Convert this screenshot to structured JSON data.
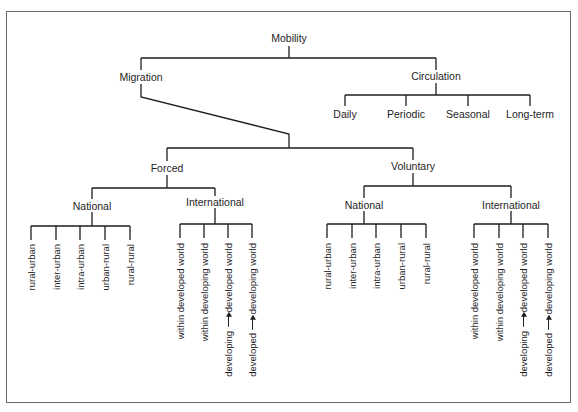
{
  "diagram": {
    "root": "Mobility",
    "level1": {
      "migration": "Migration",
      "circulation": "Circulation"
    },
    "circulation_types": [
      "Daily",
      "Periodic",
      "Seasonal",
      "Long-term"
    ],
    "migration_types": {
      "forced": "Forced",
      "voluntary": "Voluntary"
    },
    "forced": {
      "national": {
        "label": "National",
        "leaves": [
          "rural-urban",
          "inter-urban",
          "intra-urban",
          "urban-rural",
          "rural-rural"
        ]
      },
      "international": {
        "label": "International",
        "leaves": [
          {
            "text": "within developed world"
          },
          {
            "text": "within developing world"
          },
          {
            "from": "developing",
            "to": "developed world",
            "arrow": "arrow-icon"
          },
          {
            "from": "developed",
            "to": "developing world",
            "arrow": "arrow-icon"
          }
        ]
      }
    },
    "voluntary": {
      "national": {
        "label": "National",
        "leaves": [
          "rural-urban",
          "inter-urban",
          "intra-urban",
          "urban-rural",
          "rural-rural"
        ]
      },
      "international": {
        "label": "International",
        "leaves": [
          {
            "text": "within developed world"
          },
          {
            "text": "within developing world"
          },
          {
            "from": "developing",
            "to": "developed world",
            "arrow": "arrow-icon"
          },
          {
            "from": "developed",
            "to": "developing world",
            "arrow": "arrow-icon"
          }
        ]
      }
    }
  },
  "colors": {
    "line": "#1e1e1e",
    "frame": "#6a6a6a",
    "background": "#ffffff"
  }
}
